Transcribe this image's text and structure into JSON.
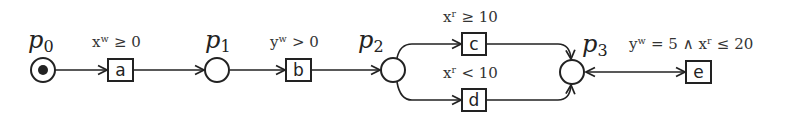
{
  "diagram": {
    "type": "petri-net",
    "places": [
      {
        "id": "p0",
        "name": "p",
        "sub": "0",
        "token": true
      },
      {
        "id": "p1",
        "name": "p",
        "sub": "1",
        "token": false
      },
      {
        "id": "p2",
        "name": "p",
        "sub": "2",
        "token": false
      },
      {
        "id": "p3",
        "name": "p",
        "sub": "3",
        "token": false
      }
    ],
    "transitions": [
      {
        "id": "a",
        "label": "a",
        "guard": "xʷ ≥ 0"
      },
      {
        "id": "b",
        "label": "b",
        "guard": "yʷ > 0"
      },
      {
        "id": "c",
        "label": "c",
        "guard": "xʳ ≥ 10"
      },
      {
        "id": "d",
        "label": "d",
        "guard": "xʳ < 10"
      },
      {
        "id": "e",
        "label": "e",
        "guard": "yʷ = 5 ∧ xʳ ≤ 20"
      }
    ],
    "arcs": [
      {
        "from": "p0",
        "to": "a"
      },
      {
        "from": "a",
        "to": "p1"
      },
      {
        "from": "p1",
        "to": "b"
      },
      {
        "from": "b",
        "to": "p2"
      },
      {
        "from": "p2",
        "to": "c"
      },
      {
        "from": "p2",
        "to": "d"
      },
      {
        "from": "c",
        "to": "p3"
      },
      {
        "from": "d",
        "to": "p3"
      },
      {
        "from": "p3",
        "to": "e",
        "bidirectional": true
      }
    ],
    "colors": {
      "stroke": "#222222",
      "background": "#ffffff"
    }
  }
}
